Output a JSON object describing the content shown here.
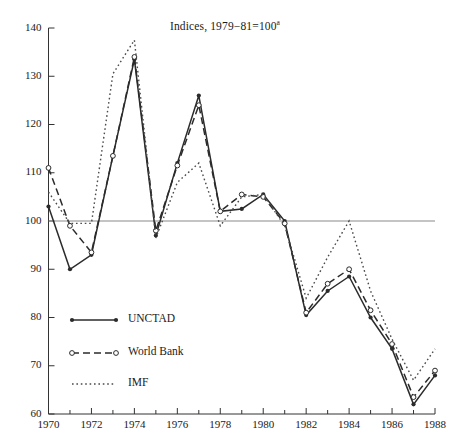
{
  "chart_data": {
    "type": "line",
    "title": "Indices, 1979−81=100",
    "title_superscript": "a",
    "xlabel": "",
    "ylabel": "",
    "xlim": [
      1970,
      1988
    ],
    "ylim": [
      60,
      140
    ],
    "ytick_labels": [
      "140",
      "130",
      "120",
      "110",
      "100",
      "90",
      "80",
      "70",
      "60"
    ],
    "ytick_values": [
      140,
      130,
      120,
      110,
      100,
      90,
      80,
      70,
      60
    ],
    "xtick_labels": [
      "1970",
      "1972",
      "1974",
      "1976",
      "1978",
      "1980",
      "1982",
      "1984",
      "1986",
      "1988"
    ],
    "xtick_values": [
      1970,
      1972,
      1974,
      1976,
      1978,
      1980,
      1982,
      1984,
      1986,
      1988
    ],
    "xminor_values": [
      1971,
      1973,
      1975,
      1977,
      1979,
      1981,
      1983,
      1985,
      1987
    ],
    "grid": false,
    "reference_line": 100,
    "legend_position": "lower-left",
    "x": [
      1970,
      1971,
      1972,
      1973,
      1974,
      1975,
      1976,
      1977,
      1978,
      1979,
      1980,
      1981,
      1982,
      1983,
      1984,
      1985,
      1986,
      1987,
      1988
    ],
    "series": [
      {
        "name": "UNCTAD",
        "style": "solid",
        "marker": "filled-circle",
        "color": "#2b2b2b",
        "values": [
          103.0,
          90.0,
          93.0,
          113.5,
          133.5,
          97.0,
          112.0,
          126.0,
          102.0,
          102.5,
          105.5,
          100.0,
          80.5,
          85.5,
          88.5,
          80.0,
          73.5,
          62.0,
          68.0
        ]
      },
      {
        "name": "World Bank",
        "style": "dashed",
        "marker": "open-circle",
        "color": "#2b2b2b",
        "values": [
          111.0,
          99.0,
          93.5,
          113.5,
          134.0,
          98.0,
          111.5,
          124.0,
          102.0,
          105.5,
          105.0,
          99.5,
          81.0,
          87.0,
          90.0,
          81.5,
          74.5,
          63.5,
          69.0
        ]
      },
      {
        "name": "IMF",
        "style": "dotted",
        "marker": "none",
        "color": "#4a4a4a",
        "values": [
          106.0,
          99.5,
          99.5,
          130.5,
          137.5,
          96.5,
          108.0,
          112.0,
          99.0,
          105.0,
          105.5,
          99.0,
          84.0,
          92.5,
          100.0,
          85.5,
          75.5,
          67.0,
          73.5
        ]
      }
    ]
  },
  "legend": {
    "items": [
      {
        "label": "UNCTAD"
      },
      {
        "label": "World Bank"
      },
      {
        "label": "IMF"
      }
    ]
  }
}
